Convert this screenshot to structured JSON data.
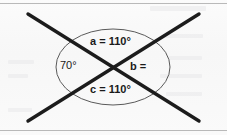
{
  "figure": {
    "name": "intersecting-lines-angle-diagram",
    "colors": {
      "line": "#1c1c1c",
      "circle": "#5a5a5a",
      "text": "#1a1a1a",
      "background": "#fafafa",
      "frame_rule": "#b9b9b9"
    },
    "geometry": {
      "center_x": 113,
      "center_y": 67,
      "circle_rx": 57,
      "circle_ry": 38,
      "line1": {
        "x1": 28,
        "y1": 14,
        "x2": 199,
        "y2": 121
      },
      "line2": {
        "x1": 199,
        "y1": 14,
        "x2": 28,
        "y2": 121
      }
    },
    "labels": {
      "top": {
        "name": "a",
        "equals": "=",
        "value": "110°",
        "text": "a = 110°"
      },
      "left": {
        "name": "",
        "equals": "",
        "value": "70°",
        "text": "70°"
      },
      "right": {
        "name": "b",
        "equals": "=",
        "value": "",
        "text": "b ="
      },
      "bottom": {
        "name": "c",
        "equals": "=",
        "value": "110°",
        "text": "c = 110°"
      }
    }
  },
  "chart_data": {
    "type": "diagram",
    "categories": [
      "a (top)",
      "70° (left)",
      "b (right)",
      "c (bottom)"
    ],
    "values": [
      110,
      70,
      null,
      110
    ],
    "units": "degrees",
    "annotations": [
      "a = 110°",
      "70°",
      "b =",
      "c = 110°"
    ]
  }
}
